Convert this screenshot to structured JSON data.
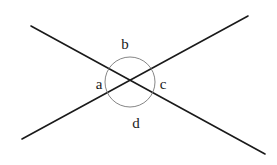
{
  "diagram": {
    "lines": [
      {
        "name": "line-1",
        "x1": 31,
        "y1": 26,
        "x2": 265,
        "y2": 154,
        "color": "#1a1a1a",
        "width": 1.6
      },
      {
        "name": "line-2",
        "x1": 22,
        "y1": 139,
        "x2": 248,
        "y2": 16,
        "color": "#1a1a1a",
        "width": 1.6
      }
    ],
    "circle": {
      "cx": 130,
      "cy": 82,
      "r": 25,
      "color": "#777777",
      "width": 0.9
    },
    "labels": {
      "a": {
        "text": "a",
        "x": 99,
        "y": 89
      },
      "b": {
        "text": "b",
        "x": 125,
        "y": 49
      },
      "c": {
        "text": "c",
        "x": 163,
        "y": 89
      },
      "d": {
        "text": "d",
        "x": 136,
        "y": 128
      }
    }
  }
}
